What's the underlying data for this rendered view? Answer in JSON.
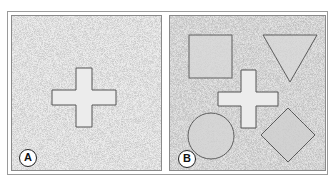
{
  "figure": {
    "panels": [
      {
        "id": "A",
        "label": "A",
        "shapes": [
          "cross"
        ]
      },
      {
        "id": "B",
        "label": "B",
        "shapes": [
          "square",
          "inverted-triangle",
          "cross",
          "circle",
          "diamond"
        ]
      }
    ],
    "colors": {
      "background_noise": "#d6d6d6",
      "shape_fill": "#ececec",
      "shape_outline": "#555555",
      "frame": "#9a9a9a"
    }
  }
}
